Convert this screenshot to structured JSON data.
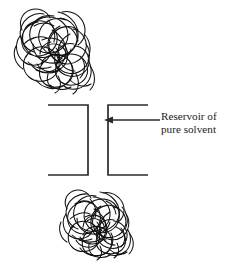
{
  "figure": {
    "background_color": "#ffffff",
    "ink_color": "#111111",
    "line_color": "#2b2b2b",
    "width": 232,
    "height": 268
  },
  "annotation": {
    "label_line_1": "Reservoir of",
    "label_line_2": "pure solvent",
    "arrow_direction": "left",
    "arrow_from_x": 160,
    "arrow_to_x": 105,
    "arrow_y": 120
  },
  "elements": {
    "top_coil_name": "polymer-random-coil-top",
    "bottom_coil_name": "polymer-random-coil-bottom",
    "left_bracket_name": "left-compartment-bracket",
    "right_bracket_name": "right-compartment-bracket",
    "membrane_gap_name": "membrane-gap"
  },
  "geometry": {
    "left_bracket": {
      "x": 48,
      "y": 105,
      "width": 40,
      "height": 70
    },
    "right_bracket": {
      "x": 107,
      "y": 105,
      "width": 41,
      "height": 70
    },
    "top_coil": {
      "x": 14,
      "y": 10,
      "width": 82,
      "height": 82
    },
    "bottom_coil": {
      "x": 58,
      "y": 192,
      "width": 74,
      "height": 66
    }
  }
}
